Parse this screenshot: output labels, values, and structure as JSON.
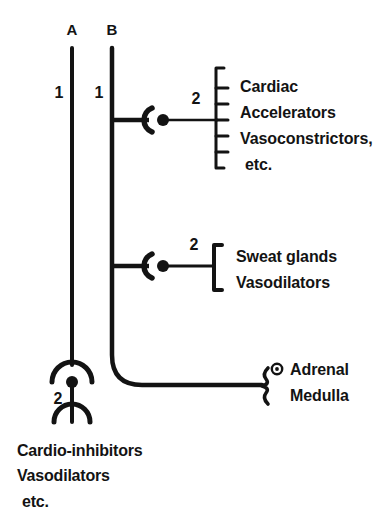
{
  "figure": {
    "background_color": "#ffffff",
    "ink_color": "#131313",
    "type": "autonomic-nervous-system-pathway-diagram"
  },
  "columns": [
    {
      "id": "A",
      "label": "A",
      "x": 72,
      "neuron_order_label": "1"
    },
    {
      "id": "B",
      "label": "B",
      "x": 112,
      "neuron_order_label": "1"
    }
  ],
  "branches": [
    {
      "id": "cardiac",
      "source_column": "B",
      "synapse_symbol": "ganglion-crescent-dot",
      "neuron_order_label": "2",
      "bracket_style": "tall-square-bracket-with-ticks",
      "tick_count": 5,
      "effector_lines": [
        "Cardiac",
        "Accelerators",
        "Vasoconstrictors,",
        "etc."
      ]
    },
    {
      "id": "sweat",
      "source_column": "B",
      "synapse_symbol": "ganglion-crescent-dot",
      "neuron_order_label": "2",
      "bracket_style": "short-square-bracket",
      "tick_count": 0,
      "effector_lines": [
        "Sweat glands",
        "Vasodilators"
      ]
    },
    {
      "id": "adrenal",
      "source_column": "B",
      "synapse_symbol": "ring-dot",
      "neuron_order_label": "",
      "bracket_style": "small-curly-brace",
      "tick_count": 0,
      "effector_lines": [
        "Adrenal",
        "Medulla"
      ]
    }
  ],
  "column_a_terminal": {
    "synapse_symbol": "arc-dot-ganglion",
    "neuron_order_label": "2",
    "terminal_symbol": "upward-fork-ending",
    "effector_lines": [
      "Cardio-inhibitors",
      "Vasodilators",
      "etc."
    ]
  }
}
